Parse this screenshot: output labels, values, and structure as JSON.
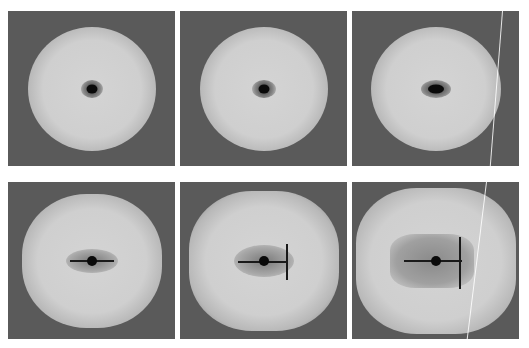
{
  "figure": {
    "layout": {
      "rows": 2,
      "cols": 3
    },
    "panels": [
      {
        "id": "top-left",
        "row": 0,
        "col": 0,
        "x": 8,
        "y": 11,
        "w": 167,
        "h": 155,
        "stage": "small-core",
        "has_scratch": false
      },
      {
        "id": "top-middle",
        "row": 0,
        "col": 1,
        "x": 180,
        "y": 11,
        "w": 167,
        "h": 155,
        "stage": "small-core",
        "has_scratch": false
      },
      {
        "id": "top-right",
        "row": 0,
        "col": 2,
        "x": 352,
        "y": 11,
        "w": 167,
        "h": 155,
        "stage": "small-core-wide",
        "has_scratch": true
      },
      {
        "id": "bottom-left",
        "row": 1,
        "col": 0,
        "x": 8,
        "y": 182,
        "w": 167,
        "h": 157,
        "stage": "horizontal-crack",
        "has_scratch": false
      },
      {
        "id": "bottom-middle",
        "row": 1,
        "col": 1,
        "x": 180,
        "y": 182,
        "w": 167,
        "h": 157,
        "stage": "branched-crack",
        "has_scratch": false
      },
      {
        "id": "bottom-right",
        "row": 1,
        "col": 2,
        "x": 352,
        "y": 182,
        "w": 167,
        "h": 157,
        "stage": "large-damage-zone",
        "has_scratch": true
      }
    ],
    "colors": {
      "background": "#ffffff",
      "panel_dark": "#5a5a5a",
      "halo_bright": "#d6d6d6",
      "core": "#0a0a0a"
    }
  }
}
